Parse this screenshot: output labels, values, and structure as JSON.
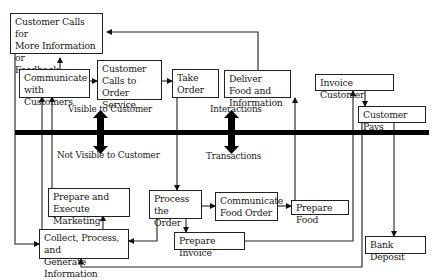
{
  "diagram": {
    "zones": {
      "above": "Visible to Customer",
      "below": "Not Visible to Customer",
      "interactions": "Interactions",
      "transactions": "Transactions"
    },
    "nodes": {
      "customer_calls_info": "Customer Calls for\nMore Information or\nFeedback",
      "communicate_customers": "Communicate\n with Customers",
      "customer_calls_order": "Customer\nCalls to Order\n Service",
      "take_order": "Take\nOrder",
      "deliver_food": "Deliver Food and\nInformation",
      "invoice_customer": "Invoice Customer",
      "customer_pays": "Customer Pays",
      "marketing": "Prepare and Execute\n Marketing Campaign",
      "process_order": "Process the\nOrder",
      "communicate_food": "Communicate\nFood Order",
      "prepare_food": "Prepare Food",
      "collect_info": "Collect, Process, and\nGenerate Information",
      "prepare_invoice": "Prepare Invoice",
      "bank_deposit": "Bank Deposit"
    },
    "edges": [
      {
        "from": "communicate_customers",
        "to": "customer_calls_info"
      },
      {
        "from": "deliver_food",
        "to": "customer_calls_info"
      },
      {
        "from": "communicate_customers",
        "to": "customer_calls_order"
      },
      {
        "from": "customer_calls_order",
        "to": "take_order"
      },
      {
        "from": "take_order",
        "to": "process_order"
      },
      {
        "from": "process_order",
        "to": "communicate_food"
      },
      {
        "from": "communicate_food",
        "to": "prepare_food"
      },
      {
        "from": "prepare_food",
        "to": "deliver_food"
      },
      {
        "from": "process_order",
        "to": "prepare_invoice"
      },
      {
        "from": "process_order",
        "to": "collect_info"
      },
      {
        "from": "prepare_invoice",
        "to": "invoice_customer"
      },
      {
        "from": "invoice_customer",
        "to": "customer_pays"
      },
      {
        "from": "customer_pays",
        "to": "bank_deposit"
      },
      {
        "from": "customer_pays",
        "to": "collect_info"
      },
      {
        "from": "customer_calls_info",
        "to": "collect_info"
      },
      {
        "from": "collect_info",
        "to": "marketing"
      },
      {
        "from": "collect_info",
        "to": "communicate_customers"
      },
      {
        "from": "marketing",
        "to": "communicate_customers"
      }
    ],
    "colors": {
      "line": "#222222",
      "divider": "#000000"
    }
  }
}
